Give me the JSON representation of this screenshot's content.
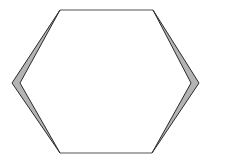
{
  "diagram": {
    "shape": "hexagon",
    "colors": {
      "background": "#ffffff",
      "stroke": "#2a2a2a",
      "sliver_fill": "#b4b4b4"
    },
    "vertices": {
      "top_left": [
        60,
        10
      ],
      "top_right": [
        153,
        10
      ],
      "right_outer": [
        199,
        83
      ],
      "right_inner": [
        191,
        83
      ],
      "bottom_right": [
        152,
        153
      ],
      "bottom_left": [
        60,
        153
      ],
      "left_outer": [
        12,
        83
      ],
      "left_inner": [
        20,
        83
      ]
    }
  }
}
